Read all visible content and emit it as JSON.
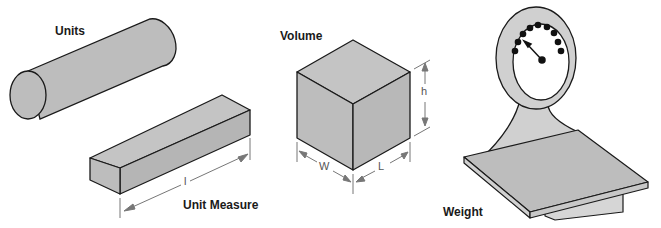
{
  "labels": {
    "units": "Units",
    "unit_measure": "Unit Measure",
    "volume": "Volume",
    "weight": "Weight"
  },
  "dimensions": {
    "length_small": "l",
    "height": "h",
    "width": "W",
    "length": "L"
  },
  "colors": {
    "fill": "#bdbdbd",
    "fill_light": "#cfcfcf",
    "stroke": "#1a1a1a",
    "dim_line": "#777777",
    "dot": "#111111"
  }
}
